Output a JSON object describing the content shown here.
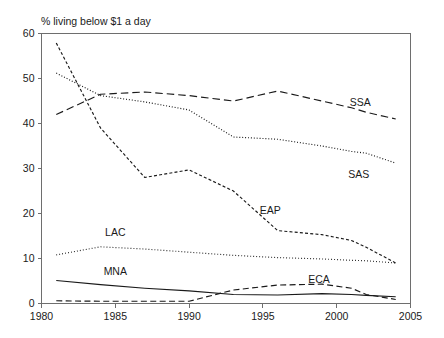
{
  "chart_data": {
    "type": "line",
    "title": "% living below $1 a day",
    "xlabel": "",
    "ylabel": "",
    "xlim": [
      1980,
      2005
    ],
    "ylim": [
      0,
      60
    ],
    "xticks": [
      "1980",
      "1985",
      "1990",
      "1995",
      "2000",
      "2005"
    ],
    "yticks": [
      "0",
      "10",
      "20",
      "30",
      "40",
      "50",
      "60"
    ],
    "grid": false,
    "legend_position": "inline-labels",
    "x": [
      1981,
      1984,
      1987,
      1990,
      1993,
      1996,
      1999,
      2001,
      2002,
      2004
    ],
    "series": [
      {
        "name": "SSA",
        "label": "SSA",
        "dash": "long-dash",
        "values": [
          42.0,
          46.5,
          47.0,
          46.2,
          45.0,
          47.2,
          45.0,
          43.5,
          42.5,
          41.0
        ],
        "label_x": 2001.6,
        "label_y": 44.0
      },
      {
        "name": "SAS",
        "label": "SAS",
        "dash": "dotted",
        "values": [
          51.2,
          46.2,
          44.8,
          43.0,
          37.0,
          36.5,
          35.0,
          33.8,
          33.4,
          31.2
        ],
        "label_x": 2001.5,
        "label_y": 28.0
      },
      {
        "name": "EAP",
        "label": "EAP",
        "dash": "short-dash",
        "values": [
          57.9,
          39.0,
          28.0,
          29.7,
          25.0,
          16.2,
          15.3,
          14.0,
          12.5,
          9.0
        ],
        "label_x": 1995.5,
        "label_y": 20.0
      },
      {
        "name": "LAC",
        "label": "LAC",
        "dash": "fine-dot",
        "values": [
          10.8,
          12.6,
          12.1,
          11.4,
          10.7,
          10.2,
          9.9,
          9.6,
          9.5,
          9.0
        ],
        "label_x": 1985.0,
        "label_y": 15.0
      },
      {
        "name": "MNA",
        "label": "MNA",
        "dash": "solid",
        "values": [
          5.1,
          4.2,
          3.4,
          2.8,
          2.0,
          1.9,
          2.2,
          2.0,
          1.8,
          1.5
        ],
        "label_x": 1985.0,
        "label_y": 6.4
      },
      {
        "name": "ECA",
        "label": "ECA",
        "dash": "medium-dash",
        "values": [
          0.6,
          0.5,
          0.5,
          0.5,
          3.0,
          4.1,
          4.3,
          3.4,
          2.0,
          0.9
        ],
        "label_x": 1998.8,
        "label_y": 4.6
      }
    ]
  }
}
